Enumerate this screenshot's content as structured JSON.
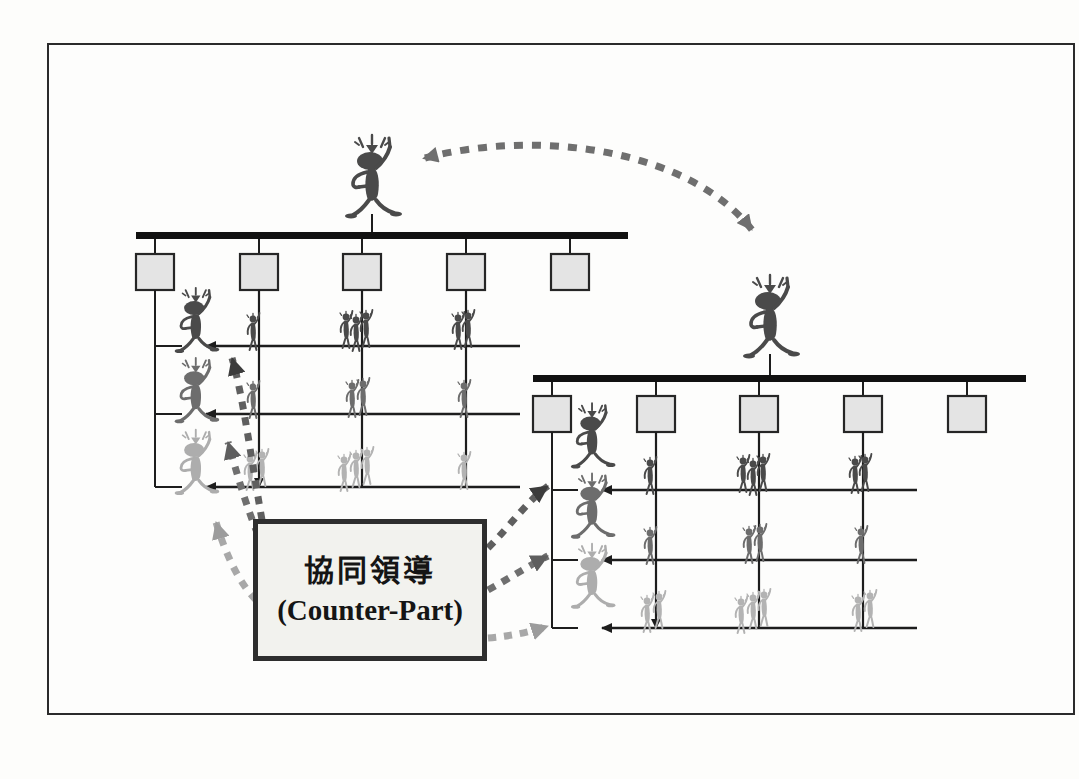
{
  "page": {
    "background": "#fdfdfb",
    "frame_color": "#2b2b2b"
  },
  "label_box": {
    "title_cn": "協同領導",
    "title_en": "(Counter-Part)",
    "border_color": "#2e2e2e",
    "fill_color": "#f2f2ee"
  },
  "palette": {
    "ink": "#1d1d1d",
    "box_fill": "#e4e4e4",
    "box_stroke": "#262626",
    "bar": "#111111",
    "figure_dark": "#4a4a4a",
    "figure_mid": "#7a7a7a",
    "figure_light": "#b9b9b9",
    "dotted": "#6f6f6f",
    "dotted_light": "#b0b0b0"
  },
  "charts": [
    {
      "id": "left-org-chart",
      "name": "left-organization",
      "boss": {
        "name": "boss-figure-left",
        "x": 372,
        "y": 178,
        "tone": "dark"
      },
      "bar": {
        "x1": 136,
        "x2": 628,
        "y": 235,
        "thickness": 7
      },
      "boxes": [
        {
          "index": 1,
          "x": 136,
          "y": 254,
          "w": 38,
          "h": 36
        },
        {
          "index": 2,
          "x": 240,
          "y": 254,
          "w": 38,
          "h": 36
        },
        {
          "index": 3,
          "x": 343,
          "y": 254,
          "w": 38,
          "h": 36
        },
        {
          "index": 4,
          "x": 447,
          "y": 254,
          "w": 38,
          "h": 36
        },
        {
          "index": 5,
          "x": 551,
          "y": 254,
          "w": 38,
          "h": 36
        }
      ],
      "rows": [
        {
          "index": 1,
          "y": 346,
          "tone": "dark"
        },
        {
          "index": 2,
          "y": 414,
          "tone": "mid"
        },
        {
          "index": 3,
          "y": 487,
          "tone": "light"
        }
      ],
      "managers": [
        {
          "index": 1,
          "x": 196,
          "y": 322,
          "tone": "dark"
        },
        {
          "index": 2,
          "x": 196,
          "y": 392,
          "tone": "mid"
        },
        {
          "index": 3,
          "x": 196,
          "y": 464,
          "tone": "light"
        }
      ],
      "spine_x": 155,
      "descender_columns": [
        259,
        362,
        466
      ]
    },
    {
      "id": "right-org-chart",
      "name": "right-organization",
      "boss": {
        "name": "boss-figure-right",
        "x": 770,
        "y": 318,
        "tone": "dark"
      },
      "bar": {
        "x1": 533,
        "x2": 1026,
        "y": 378,
        "thickness": 7
      },
      "boxes": [
        {
          "index": 1,
          "x": 533,
          "y": 396,
          "w": 38,
          "h": 36
        },
        {
          "index": 2,
          "x": 637,
          "y": 396,
          "w": 38,
          "h": 36
        },
        {
          "index": 3,
          "x": 740,
          "y": 396,
          "w": 38,
          "h": 36
        },
        {
          "index": 4,
          "x": 844,
          "y": 396,
          "w": 38,
          "h": 36
        },
        {
          "index": 5,
          "x": 948,
          "y": 396,
          "w": 38,
          "h": 36
        }
      ],
      "rows": [
        {
          "index": 1,
          "y": 490,
          "tone": "dark"
        },
        {
          "index": 2,
          "y": 560,
          "tone": "mid"
        },
        {
          "index": 3,
          "y": 628,
          "tone": "light"
        }
      ],
      "managers": [
        {
          "index": 1,
          "x": 592,
          "y": 466,
          "tone": "dark"
        },
        {
          "index": 2,
          "x": 592,
          "y": 536,
          "tone": "mid"
        },
        {
          "index": 3,
          "x": 592,
          "y": 606,
          "tone": "light"
        }
      ],
      "spine_x": 552,
      "descender_columns": [
        656,
        759,
        863
      ]
    }
  ],
  "connectors": {
    "boss_link": {
      "name": "boss-to-boss-dashed-arrow",
      "double_headed": true,
      "from": [
        418,
        158
      ],
      "to": [
        758,
        238
      ],
      "style": "dashed",
      "color": "#6f6f6f"
    },
    "counterpart_links_left": [
      {
        "index": 1,
        "target_manager": 1,
        "tone": "dark"
      },
      {
        "index": 2,
        "target_manager": 2,
        "tone": "mid"
      },
      {
        "index": 3,
        "target_manager": 3,
        "tone": "light"
      }
    ],
    "counterpart_links_right": [
      {
        "index": 1,
        "target_manager": 1,
        "tone": "dark"
      },
      {
        "index": 2,
        "target_manager": 2,
        "tone": "mid"
      },
      {
        "index": 3,
        "target_manager": 3,
        "tone": "light"
      }
    ]
  },
  "worker_groups": {
    "left": [
      {
        "row": 1,
        "col_x": 259,
        "count": 1,
        "tone": "dark"
      },
      {
        "row": 1,
        "col_x": 362,
        "count": 3,
        "tone": "dark"
      },
      {
        "row": 1,
        "col_x": 466,
        "count": 2,
        "tone": "dark"
      },
      {
        "row": 2,
        "col_x": 259,
        "count": 1,
        "tone": "mid"
      },
      {
        "row": 2,
        "col_x": 362,
        "count": 2,
        "tone": "mid"
      },
      {
        "row": 2,
        "col_x": 466,
        "count": 1,
        "tone": "mid"
      },
      {
        "row": 3,
        "col_x": 259,
        "count": 2,
        "tone": "light"
      },
      {
        "row": 3,
        "col_x": 362,
        "count": 3,
        "tone": "light"
      },
      {
        "row": 3,
        "col_x": 466,
        "count": 1,
        "tone": "light"
      }
    ],
    "right": [
      {
        "row": 1,
        "col_x": 656,
        "count": 1,
        "tone": "dark"
      },
      {
        "row": 1,
        "col_x": 759,
        "count": 3,
        "tone": "dark"
      },
      {
        "row": 1,
        "col_x": 863,
        "count": 2,
        "tone": "dark"
      },
      {
        "row": 2,
        "col_x": 656,
        "count": 1,
        "tone": "mid"
      },
      {
        "row": 2,
        "col_x": 759,
        "count": 2,
        "tone": "mid"
      },
      {
        "row": 2,
        "col_x": 863,
        "count": 1,
        "tone": "mid"
      },
      {
        "row": 3,
        "col_x": 656,
        "count": 2,
        "tone": "light"
      },
      {
        "row": 3,
        "col_x": 759,
        "count": 3,
        "tone": "light"
      },
      {
        "row": 3,
        "col_x": 863,
        "count": 2,
        "tone": "light"
      }
    ]
  }
}
